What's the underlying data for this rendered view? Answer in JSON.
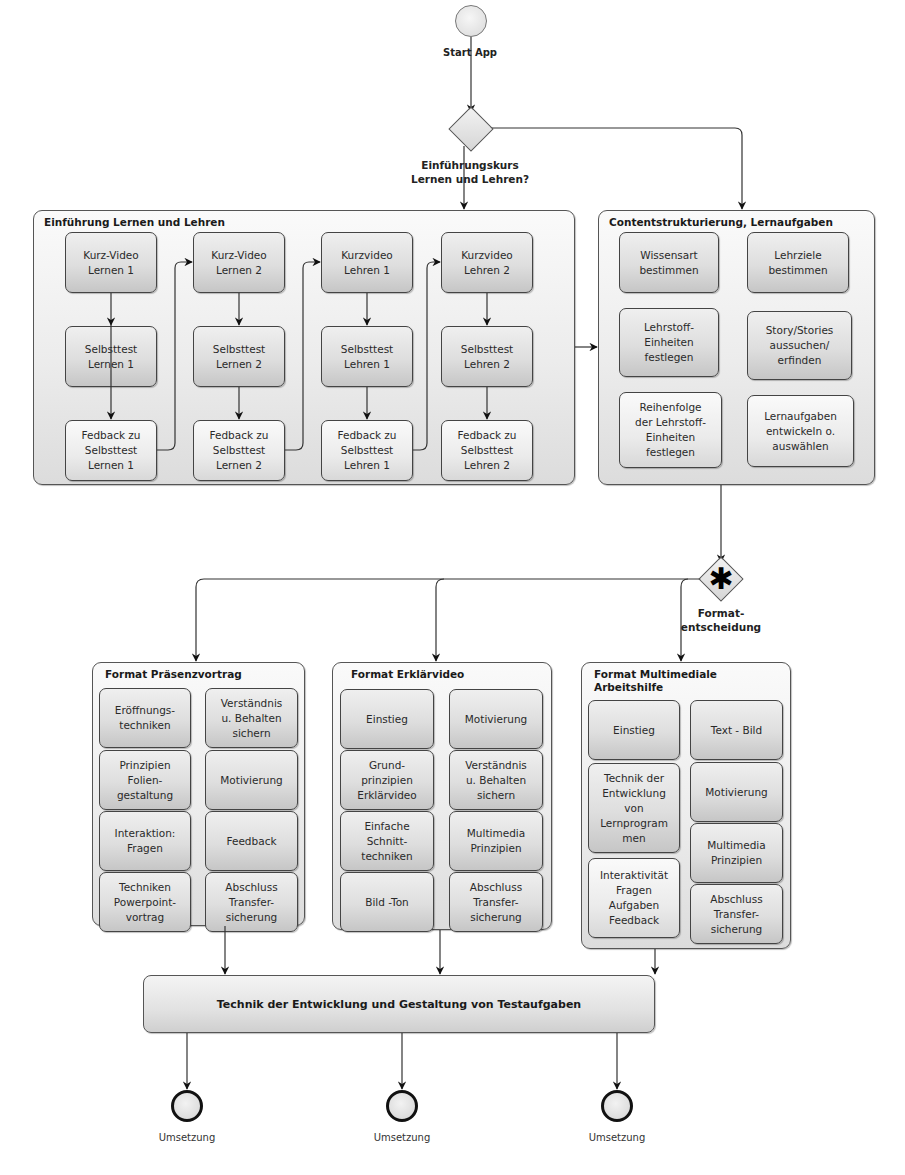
{
  "start": {
    "label": "Start  App"
  },
  "gateway1": {
    "label": "Einführungskurs\nLernen und Lehren?"
  },
  "einfuehrung": {
    "title": "Einführung Lernen und Lehren",
    "columns": [
      {
        "video": "Kurz-Video\nLernen 1",
        "test": "Selbsttest\nLernen 1",
        "feedback": "Fedback zu\nSelbsttest\nLernen 1"
      },
      {
        "video": "Kurz-Video\nLernen 2",
        "test": "Selbsttest\nLernen 2",
        "feedback": "Fedback zu\nSelbsttest\nLernen 2"
      },
      {
        "video": "Kurzvideo\nLehren 1",
        "test": "Selbsttest\nLehren 1",
        "feedback": "Fedback zu\nSelbsttest\nLehren 1"
      },
      {
        "video": "Kurzvideo\nLehren 2",
        "test": "Selbsttest\nLehren 2",
        "feedback": "Fedback zu\nSelbsttest\nLehren 2"
      }
    ]
  },
  "content": {
    "title": "Contentstrukturierung, Lernaufgaben",
    "items": [
      "Wissensart\nbestimmen",
      "Lehrziele\nbestimmen",
      "Lehrstoff-\nEinheiten\nfestlegen",
      "Story/Stories\naussuchen/\nerfinden",
      "Reihenfolge\nder Lehrstoff-\nEinheiten\nfestlegen",
      "Lernaufgaben\nentwickeln o.\nauswählen"
    ]
  },
  "gateway2": {
    "label": "Format-\nentscheidung",
    "symbol": "✱"
  },
  "formats": [
    {
      "title": "Format Präsenzvortrag",
      "left": [
        "Eröffnungs-\ntechniken",
        "Prinzipien\nFolien-\ngestaltung",
        "Interaktion:\nFragen",
        "Techniken\nPowerpoint-\nvortrag"
      ],
      "right": [
        "Verständnis\nu. Behalten\nsichern",
        "Motivierung",
        "Feedback",
        "Abschluss\nTransfer-\nsicherung"
      ]
    },
    {
      "title": "Format Erklärvideo",
      "left": [
        "Einstieg",
        "Grund-\nprinzipien\nErklärvideo",
        "Einfache\nSchnitt-\ntechniken",
        "Bild -Ton"
      ],
      "right": [
        "Motivierung",
        "Verständnis\nu. Behalten\nsichern",
        "Multimedia\nPrinzipien",
        "Abschluss\nTransfer-\nsicherung"
      ]
    },
    {
      "title": "Format Multimediale\nArbeitshilfe",
      "left": [
        "Einstieg",
        "Technik der\nEntwicklung\nvon\nLernprogram\nmen",
        "Interaktivität\nFragen\nAufgaben\nFeedback"
      ],
      "right": [
        "Text - Bild",
        "Motivierung",
        "Multimedia\nPrinzipien",
        "Abschluss\nTransfer-\nsicherung"
      ]
    }
  ],
  "testaufgaben": {
    "label": "Technik der Entwicklung und Gestaltung von Testaufgaben"
  },
  "end_events": [
    {
      "label": "Umsetzung"
    },
    {
      "label": "Umsetzung"
    },
    {
      "label": "Umsetzung"
    }
  ],
  "colors": {
    "line": "#333333",
    "box_border": "#444444",
    "container_border": "#555555"
  }
}
